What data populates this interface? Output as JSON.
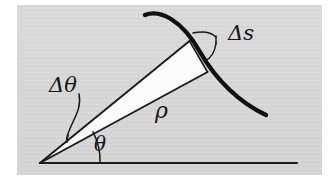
{
  "figure": {
    "kind": "geometry-diagram",
    "background_color": "#d6d6d6",
    "page_color": "#ffffff",
    "ink_color": "#1a1a1a",
    "wedge_fill_color": "#fdfdfd",
    "panel": {
      "x": 17,
      "y": 5,
      "width": 305,
      "height": 170
    },
    "labels": {
      "delta_s": "Δs",
      "delta_theta": "Δθ",
      "rho": "ρ",
      "theta": "θ"
    },
    "label_positions": {
      "delta_s": {
        "x": 228,
        "y": 34
      },
      "delta_theta": {
        "x": 72,
        "y": 86
      },
      "rho": {
        "x": 163,
        "y": 111
      },
      "theta": {
        "x": 101,
        "y": 144
      }
    },
    "geometry": {
      "vertex": {
        "x": 40,
        "y": 163
      },
      "baseline": {
        "x1": 40,
        "y1": 163,
        "x2": 297,
        "y2": 163
      },
      "wedge_outer_point": {
        "x": 189,
        "y": 41
      },
      "wedge_inner_point": {
        "x": 207,
        "y": 72
      },
      "curve_start": {
        "x": 145,
        "y": 15
      },
      "curve_end": {
        "x": 266,
        "y": 115
      },
      "theta_arc_radius": 60,
      "delta_theta_arc_radius": 32
    }
  }
}
